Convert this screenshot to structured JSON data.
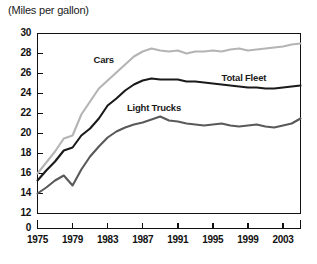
{
  "chart_data": {
    "type": "line",
    "title": "(Miles per gallon)",
    "xlabel": "",
    "ylabel": "Miles per gallon",
    "grid": false,
    "legend_position": "inline-annotations",
    "xlim": [
      1975,
      2005
    ],
    "ylim": [
      12,
      30
    ],
    "y_axis_break": true,
    "y_break_from": 0,
    "y_break_to": 12,
    "yticks": [
      0,
      12,
      14,
      16,
      18,
      20,
      22,
      24,
      26,
      28,
      30
    ],
    "ytick_labels": [
      "0",
      "12",
      "14",
      "16",
      "18",
      "20",
      "22",
      "24",
      "26",
      "28",
      "30"
    ],
    "xticks": [
      1975,
      1979,
      1983,
      1987,
      1991,
      1995,
      1999,
      2003
    ],
    "xtick_labels": [
      "1975",
      "1979",
      "1983",
      "1987",
      "1991",
      "1995",
      "1999",
      "2003"
    ],
    "x": [
      1975,
      1976,
      1977,
      1978,
      1979,
      1980,
      1981,
      1982,
      1983,
      1984,
      1985,
      1986,
      1987,
      1988,
      1989,
      1990,
      1991,
      1992,
      1993,
      1994,
      1995,
      1996,
      1997,
      1998,
      1999,
      2000,
      2001,
      2002,
      2003,
      2004,
      2005
    ],
    "series": [
      {
        "name": "Cars",
        "color": "#b4b4b4",
        "label_x": 1981.4,
        "label_y": 27.4,
        "values": [
          16.0,
          17.1,
          18.2,
          19.5,
          19.8,
          21.9,
          23.2,
          24.5,
          25.3,
          26.1,
          26.9,
          27.7,
          28.2,
          28.5,
          28.3,
          28.2,
          28.3,
          28.0,
          28.2,
          28.2,
          28.3,
          28.2,
          28.4,
          28.5,
          28.3,
          28.4,
          28.5,
          28.6,
          28.7,
          28.9,
          29.0
        ]
      },
      {
        "name": "Total Fleet",
        "color": "#1a1a1a",
        "label_x": 1996.0,
        "label_y": 25.6,
        "values": [
          15.3,
          16.3,
          17.2,
          18.3,
          18.6,
          19.8,
          20.5,
          21.5,
          22.8,
          23.5,
          24.3,
          24.9,
          25.3,
          25.5,
          25.4,
          25.4,
          25.4,
          25.2,
          25.2,
          25.1,
          25.0,
          24.9,
          24.8,
          24.7,
          24.6,
          24.6,
          24.5,
          24.5,
          24.6,
          24.7,
          24.8
        ]
      },
      {
        "name": "Light Trucks",
        "color": "#595959",
        "label_x": 1985.2,
        "label_y": 22.6,
        "values": [
          14.0,
          14.6,
          15.3,
          15.8,
          14.8,
          16.4,
          17.7,
          18.7,
          19.6,
          20.2,
          20.6,
          20.9,
          21.1,
          21.4,
          21.7,
          21.3,
          21.2,
          21.0,
          20.9,
          20.8,
          20.9,
          21.0,
          20.8,
          20.7,
          20.8,
          20.9,
          20.7,
          20.6,
          20.8,
          21.0,
          21.5
        ]
      }
    ]
  }
}
